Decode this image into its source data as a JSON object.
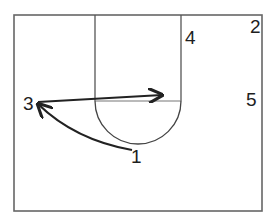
{
  "diagram": {
    "type": "basketball-half-court-play",
    "colors": {
      "court_lines": "#555555",
      "movement": "#222222",
      "labels": "#1e1e1e"
    },
    "players": [
      {
        "id": "1",
        "label": "1",
        "x": 136,
        "y": 162
      },
      {
        "id": "2",
        "label": "2",
        "x": 255,
        "y": 33
      },
      {
        "id": "3",
        "label": "3",
        "x": 29,
        "y": 109
      },
      {
        "id": "4",
        "label": "4",
        "x": 191,
        "y": 43
      },
      {
        "id": "5",
        "label": "5",
        "x": 251,
        "y": 106
      }
    ],
    "actions": [
      {
        "type": "pass",
        "from": "1",
        "to": "3",
        "style": "curved-arrow"
      },
      {
        "type": "cut",
        "from": "3",
        "to": "lane-high-post",
        "style": "straight-arrow"
      }
    ]
  }
}
